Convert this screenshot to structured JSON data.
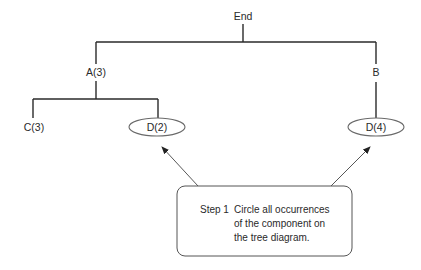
{
  "diagram": {
    "type": "tree",
    "nodes": [
      {
        "id": "end",
        "label": "End",
        "circled": false
      },
      {
        "id": "a",
        "label": "A(3)",
        "circled": false
      },
      {
        "id": "b",
        "label": "B",
        "circled": false
      },
      {
        "id": "c",
        "label": "C(3)",
        "circled": false
      },
      {
        "id": "d2",
        "label": "D(2)",
        "circled": true
      },
      {
        "id": "d4",
        "label": "D(4)",
        "circled": true
      }
    ],
    "edges": [
      {
        "from": "end",
        "to": "a"
      },
      {
        "from": "end",
        "to": "b"
      },
      {
        "from": "a",
        "to": "c"
      },
      {
        "from": "a",
        "to": "d2"
      },
      {
        "from": "b",
        "to": "d4"
      }
    ],
    "callout": {
      "step": "Step 1",
      "lines": [
        "Circle all occurrences",
        "of the component on",
        "the tree diagram."
      ],
      "points_to": [
        "d2",
        "d4"
      ]
    }
  },
  "colors": {
    "line": "#2a2a2a",
    "ellipse": "#6a6a6a",
    "background": "#ffffff"
  }
}
